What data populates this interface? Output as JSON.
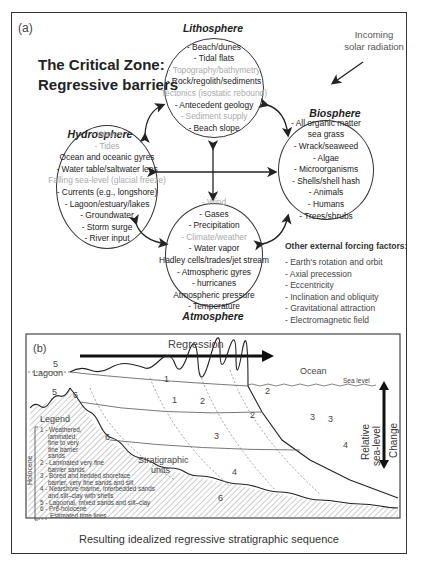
{
  "panel_a": {
    "label": "(a)",
    "title_line1": "The Critical Zone:",
    "title_line2": "Regressive barriers",
    "solar": {
      "line1": "Incoming",
      "line2": "solar radiation"
    },
    "lithosphere": {
      "name": "Lithosphere",
      "items": [
        {
          "text": "- Beach/dunes",
          "faded": false
        },
        {
          "text": "- Tidal flats",
          "faded": false
        },
        {
          "text": "- Topography/bathymetry",
          "faded": true
        },
        {
          "text": "- Rock/regolith/sediments",
          "faded": false
        },
        {
          "text": "Tectonics (isostatic rebound)",
          "faded": true
        },
        {
          "text": "- Antecedent geology",
          "faded": false
        },
        {
          "text": "- Sediment supply",
          "faded": true
        },
        {
          "text": "- Beach slope",
          "faded": false
        }
      ]
    },
    "hydrosphere": {
      "name": "Hydrosphere",
      "items": [
        {
          "text": "- Waves",
          "faded": true
        },
        {
          "text": "- Tides",
          "faded": true
        },
        {
          "text": "Ocean and oceanic gyres",
          "faded": false
        },
        {
          "text": "- Water table/saltwater lens",
          "faded": false
        },
        {
          "text": "Falling sea-level (glacial freeze)",
          "faded": true
        },
        {
          "text": "- Currents (e.g., longshore)",
          "faded": false
        },
        {
          "text": "- Lagoon/estuary/lakes",
          "faded": false
        },
        {
          "text": "- Groundwater",
          "faded": false
        },
        {
          "text": "- Storm surge",
          "faded": false
        },
        {
          "text": "- River input",
          "faded": false
        }
      ]
    },
    "biosphere": {
      "name": "Biosphere",
      "items": [
        {
          "text": "- All organic matter",
          "faded": false
        },
        {
          "text": "sea grass",
          "faded": false
        },
        {
          "text": "- Wrack/seaweed",
          "faded": false
        },
        {
          "text": "- Algae",
          "faded": false
        },
        {
          "text": "- Microorganisms",
          "faded": false
        },
        {
          "text": "- Shells/shell hash",
          "faded": false
        },
        {
          "text": "- Animals",
          "faded": false
        },
        {
          "text": "- Humans",
          "faded": false
        },
        {
          "text": "- Trees/shrubs",
          "faded": false
        }
      ]
    },
    "atmosphere": {
      "name": "Atmosphere",
      "items": [
        {
          "text": "- Wind",
          "faded": true
        },
        {
          "text": "- Gases",
          "faded": false
        },
        {
          "text": "- Precipitation",
          "faded": false
        },
        {
          "text": "- Climate/weather",
          "faded": true
        },
        {
          "text": "- Water vapor",
          "faded": false
        },
        {
          "text": "Hadley cells/trades/jet stream",
          "faded": false
        },
        {
          "text": "- Atmospheric gyres",
          "faded": false
        },
        {
          "text": "- hurricanes",
          "faded": false
        },
        {
          "text": "Atmospheric pressure",
          "faded": false
        },
        {
          "text": "- Temperature",
          "faded": false
        }
      ]
    },
    "forcing": {
      "title": "Other external forcing factors:",
      "items": [
        "- Earth's rotation and orbit",
        "- Axial precession",
        "- Eccentricity",
        "- Inclination and obliquity",
        "- Gravitational attraction",
        "- Electromagnetic field"
      ]
    }
  },
  "panel_b": {
    "label": "(b)",
    "regression_label": "Regression",
    "lagoon_label": "Lagoon",
    "ocean_label": "Ocean",
    "sea_level_label": "Sea level",
    "stratigraphic_label_1": "Stratigraphic",
    "stratigraphic_label_2": "units",
    "rsl_label_1": "Relative",
    "rsl_label_2": "sea-level",
    "rsl_label_3": "Change",
    "unit_numbers": [
      "1",
      "1",
      "2",
      "2",
      "2",
      "3",
      "3",
      "3",
      "4",
      "4",
      "5",
      "5",
      "6",
      "6",
      "6"
    ],
    "legend": {
      "title": "Legend",
      "holocene_label": "Holocene",
      "items": [
        "1 - Weathered,",
        "laminated,",
        "fine to very",
        "fine barrier",
        "sands",
        "2 - Laminated very fine",
        "barrier sands",
        "3 - Bored and bedded shoreface",
        "barrier, very fine sands and silt",
        "4 - Nearshore marine, interbedded sands",
        "and silt–clay with shells",
        "5 - Lagoonal, mixed sands and silt–clay",
        "6 - Pre-holocene",
        "Estimated time lines"
      ]
    }
  },
  "caption": "Resulting idealized regressive stratigraphic sequence"
}
